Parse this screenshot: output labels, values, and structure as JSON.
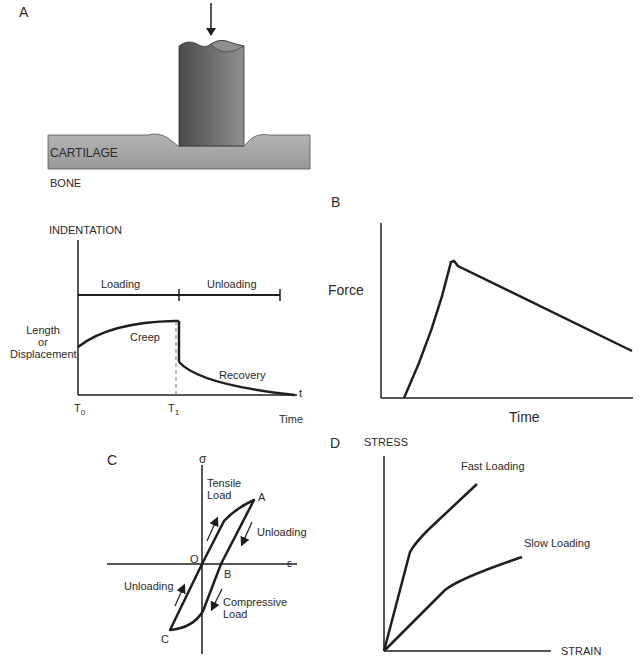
{
  "panels": {
    "a": {
      "letter": "A",
      "cartilage_label": "CARTILAGE",
      "bone_label": "BONE",
      "indentation_label": "INDENTATION",
      "loading_label": "Loading",
      "unloading_label": "Unloading",
      "ylabel_line1": "Length",
      "ylabel_line2": "or",
      "ylabel_line3": "Displacement",
      "creep_label": "Creep",
      "recovery_label": "Recovery",
      "t_axis": "t",
      "t0_label": "T",
      "t0_sub": "0",
      "t1_label": "T",
      "t1_sub": "1",
      "xlabel": "Time"
    },
    "b": {
      "letter": "B",
      "ylabel": "Force",
      "xlabel": "Time"
    },
    "c": {
      "letter": "C",
      "y_axis": "σ",
      "x_axis": "ε",
      "tensile_line1": "Tensile",
      "tensile_line2": "Load",
      "point_a": "A",
      "point_b": "B",
      "point_c": "C",
      "point_o": "O",
      "unloading_right": "Unloading",
      "unloading_left": "Unloading",
      "compressive_line1": "Compressive",
      "compressive_line2": "Load"
    },
    "d": {
      "letter": "D",
      "ylabel": "STRESS",
      "xlabel": "STRAIN",
      "fast_label": "Fast Loading",
      "slow_label": "Slow Loading"
    }
  },
  "colors": {
    "line": "#1e1e1e",
    "cartilage": "#a8a8a8",
    "indenter_dark": "#5c5c5c",
    "indenter_light": "#8a8a8a"
  }
}
